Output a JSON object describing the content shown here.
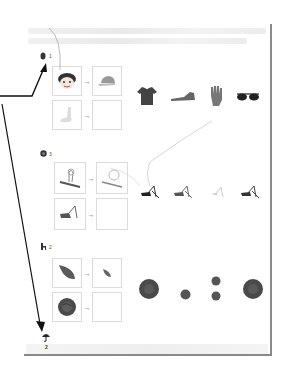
{
  "page": {
    "header_text": "",
    "footer_text": ""
  },
  "exercises": [
    {
      "number": "1",
      "head_icon": "figure-icon",
      "pairs": [
        {
          "left": "boy-face-icon",
          "right": "cap-icon"
        },
        {
          "left": "foot-icon",
          "right": ""
        }
      ],
      "arrow": "→",
      "options": [
        "tshirt-icon",
        "shoe-icon",
        "glove-icon",
        "sunglasses-icon"
      ]
    },
    {
      "number": "3",
      "head_icon": "circle-icon",
      "pairs": [
        {
          "left": "grasshopper-outline-icon",
          "right": "grasshopper-faded-icon"
        },
        {
          "left": "cricket-icon",
          "right": ""
        }
      ],
      "arrow": "→",
      "options": [
        "cricket-dark-icon",
        "cricket-medium-icon",
        "cricket-faded-icon",
        "cricket-dark-icon"
      ]
    },
    {
      "number": "2",
      "head_icon": "chair-icon",
      "pairs": [
        {
          "left": "leaf-large-icon",
          "right": "leaf-small-icon"
        },
        {
          "left": "rose-large-icon",
          "right": ""
        }
      ],
      "arrow": "→",
      "options": [
        "rose-large-icon",
        "rose-small-icon",
        "rose-pair-icon",
        "rose-large-icon"
      ]
    }
  ],
  "annotations": {
    "umbrella_label": "2",
    "arrow_color": "#111111",
    "curve_color": "#bbbbbb"
  }
}
